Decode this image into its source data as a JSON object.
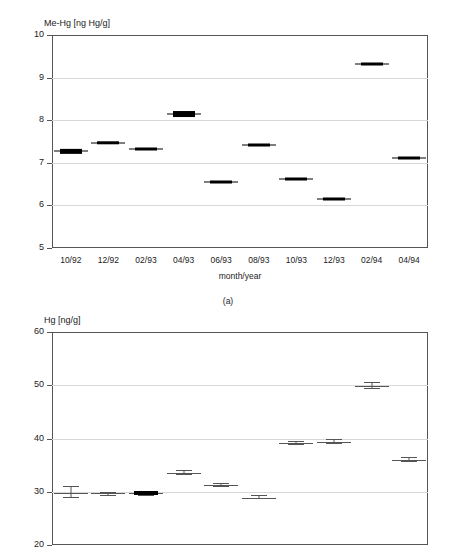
{
  "figure": {
    "caption_a": "(a)"
  },
  "panel_a": {
    "title": "Me-Hg [ng Hg/g]",
    "xlabel": "month/year",
    "ytick_labels": [
      "10",
      "9",
      "8",
      "7",
      "6",
      "5"
    ],
    "xtick_labels": [
      "10/92",
      "12/92",
      "02/93",
      "04/93",
      "06/93",
      "08/93",
      "10/93",
      "12/93",
      "02/94",
      "04/94"
    ]
  },
  "panel_b": {
    "title": "Hg [ng/g]",
    "ytick_labels": [
      "60",
      "50",
      "40",
      "30",
      "20"
    ]
  },
  "chart_data": [
    {
      "type": "scatter",
      "title": "Me-Hg [ng Hg/g]",
      "subtitle": "(a)",
      "xlabel": "month/year",
      "ylabel": "Me-Hg [ng Hg/g]",
      "ylim": [
        5,
        10
      ],
      "yticks": [
        5,
        6,
        7,
        8,
        9,
        10
      ],
      "grid": "horizontal",
      "legend": "none",
      "categories": [
        "10/92",
        "12/92",
        "02/93",
        "04/93",
        "06/93",
        "08/93",
        "10/93",
        "12/93",
        "02/94",
        "04/94"
      ],
      "values": [
        7.27,
        7.47,
        7.33,
        8.15,
        6.55,
        7.42,
        6.63,
        6.15,
        9.32,
        7.12
      ],
      "err_low": [
        7.22,
        7.43,
        7.31,
        8.08,
        6.52,
        7.41,
        6.6,
        6.12,
        9.29,
        7.09
      ],
      "err_high": [
        7.32,
        7.51,
        7.35,
        8.22,
        6.58,
        7.43,
        6.66,
        6.18,
        9.35,
        7.15
      ],
      "marker": "filled-box-with-whiskers"
    },
    {
      "type": "scatter",
      "title": "Hg [ng/g]",
      "xlabel": "month/year",
      "ylabel": "Hg [ng/g]",
      "ylim": [
        20,
        60
      ],
      "yticks": [
        20,
        30,
        40,
        50,
        60
      ],
      "grid": "horizontal",
      "legend": "none",
      "categories": [
        "10/92",
        "12/92",
        "02/93",
        "04/93",
        "06/93",
        "08/93",
        "10/93",
        "12/93",
        "02/94",
        "04/94"
      ],
      "values": [
        29.7,
        29.7,
        29.7,
        33.5,
        31.3,
        28.9,
        39.2,
        39.4,
        49.9,
        36.0
      ],
      "err_low": [
        28.9,
        29.4,
        29.5,
        33.1,
        31.0,
        28.6,
        38.9,
        39.0,
        49.3,
        35.6
      ],
      "err_high": [
        31.0,
        30.0,
        29.9,
        34.0,
        31.7,
        29.3,
        39.6,
        40.0,
        50.6,
        36.5
      ],
      "marker": "error-bar-ibeam"
    }
  ]
}
